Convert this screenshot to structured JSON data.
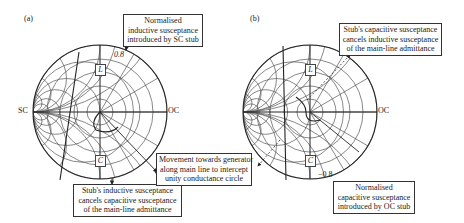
{
  "panels": [
    {
      "id": "a",
      "label": "(a)",
      "left_end_label": "SC",
      "right_end_label": "OC",
      "marker_L": "L",
      "marker_C": "C",
      "susceptance_value": "0.8",
      "callout_top": [
        "Normalised",
        "inductive susceptance",
        "introduced by SC stub"
      ],
      "callout_bottom": [
        "Stub's inductive susceptance",
        "cancels capacitive susceptance",
        "of the main-line admittance"
      ]
    },
    {
      "id": "b",
      "label": "(b)",
      "right_end_label": "OC",
      "marker_L": "L",
      "marker_C": "C",
      "susceptance_value": "−0.8",
      "callout_top": [
        "Stub's capacitive susceptance",
        "cancels inductive susceptance",
        "of the main-line admittance"
      ],
      "callout_bottom": [
        "Normalised",
        "capacitive susceptance",
        "introduced by OC stub"
      ]
    }
  ],
  "shared_callout": [
    "Movement towards generator",
    "along main line to intercept",
    "unity conductance circle"
  ],
  "colors": {
    "grid": "#555555",
    "line": "#222222",
    "background": "#ffffff"
  }
}
